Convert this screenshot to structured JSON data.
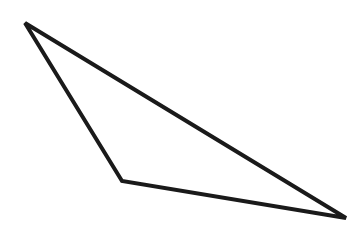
{
  "diagram": {
    "shape": "triangle",
    "background": "#ffffff",
    "stroke_color": "#1a1a1a",
    "stroke_width": 4,
    "vertices": [
      {
        "name": "top-left",
        "x": 25,
        "y": 23
      },
      {
        "name": "bottom-middle",
        "x": 122,
        "y": 181
      },
      {
        "name": "right",
        "x": 346,
        "y": 218
      }
    ]
  }
}
